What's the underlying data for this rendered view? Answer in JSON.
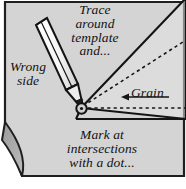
{
  "figure": {
    "kind": "sewing-template-marking-diagram",
    "colors": {
      "fabric": "#d4d4d4",
      "fabric_fold": "#a8a8a8",
      "outline": "#1a1a1a",
      "pencil_body": "#f2f2f2",
      "pencil_shade": "#d9d9d9",
      "template_fill": "#e8e8e8",
      "paper": "#ffffff",
      "text": "#111111"
    },
    "labels": {
      "trace": "Trace\naround\ntemplate\nand...",
      "trace_lines": [
        "Trace",
        "around",
        "template",
        "and..."
      ],
      "wrong_side": "Wrong\nside",
      "wrong_side_lines": [
        "Wrong",
        "side"
      ],
      "grain": "Grain",
      "mark": "Mark at\nintersections\nwith a dot...",
      "mark_lines": [
        "Mark at",
        "intersections",
        "with a dot..."
      ]
    },
    "annotations": {
      "grain_arrow_direction": "left",
      "dot_marker": "intersection-dot",
      "dashed_line": "seam-line",
      "pencil": "marking-pencil"
    }
  }
}
